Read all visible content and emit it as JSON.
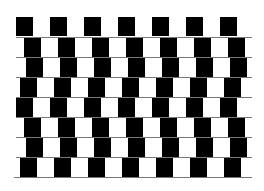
{
  "figure": {
    "name": "cafe-wall-illusion",
    "colors": {
      "background": "#ffffff",
      "tile": "#000000",
      "mortar": "#777777"
    },
    "tile_width": 17,
    "tile_pitch": 34,
    "rows": [
      {
        "top": 17,
        "left": 16,
        "right": 240,
        "offset": 0
      },
      {
        "top": 38,
        "left": 20,
        "right": 252,
        "offset": 4
      },
      {
        "top": 58,
        "left": 16,
        "right": 252,
        "offset": 10
      },
      {
        "top": 78,
        "left": 16,
        "right": 252,
        "offset": 4
      },
      {
        "top": 98,
        "left": 16,
        "right": 252,
        "offset": 0
      },
      {
        "top": 118,
        "left": 20,
        "right": 252,
        "offset": 4
      },
      {
        "top": 138,
        "left": 16,
        "right": 252,
        "offset": 10
      },
      {
        "top": 158,
        "left": 16,
        "right": 252,
        "offset": 4
      }
    ],
    "caption": ""
  }
}
